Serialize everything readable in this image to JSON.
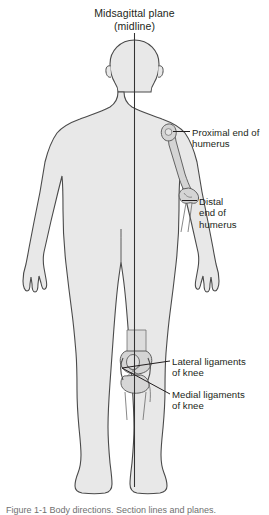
{
  "figure": {
    "type": "anatomical-diagram",
    "title_line1": "Midsagittal plane",
    "title_line2": "(midline)",
    "caption": "Figure 1-1  Body directions. Section lines and planes.",
    "colors": {
      "body_fill": "#e8e8e8",
      "body_outline": "#4a4a4a",
      "bone_fill": "#d4d4d4",
      "bone_outline": "#555555",
      "midline": "#333333",
      "leader_line": "#231f20",
      "text": "#231f20",
      "background": "#ffffff"
    },
    "labels": [
      {
        "id": "proximal-humerus",
        "line1": "Proximal end of",
        "line2": "humerus",
        "points_to": "proximal-end-of-humerus"
      },
      {
        "id": "distal-humerus",
        "line1": "Distal",
        "line2": "end of",
        "line3": "humerus",
        "points_to": "distal-end-of-humerus"
      },
      {
        "id": "lateral-ligaments",
        "line1": "Lateral ligaments",
        "line2": "of knee",
        "points_to": "lateral-ligaments-of-knee"
      },
      {
        "id": "medial-ligaments",
        "line1": "Medial ligaments",
        "line2": "of knee",
        "points_to": "medial-ligaments-of-knee"
      }
    ]
  }
}
